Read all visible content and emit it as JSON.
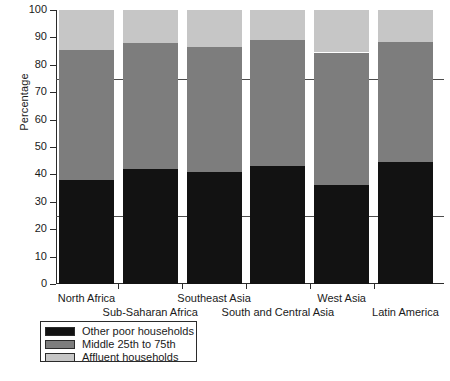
{
  "chart_data": {
    "type": "bar",
    "subtype": "stacked-100-percent",
    "title": "",
    "xlabel": "",
    "ylabel": "Percentage",
    "ylim": [
      0,
      100
    ],
    "yticks": [
      0,
      10,
      20,
      30,
      40,
      50,
      60,
      70,
      80,
      90,
      100
    ],
    "grid": false,
    "reference_lines": [
      25,
      75
    ],
    "legend_position": "below-left",
    "categories": [
      "North Africa",
      "Sub-Saharan Africa",
      "Southeast Asia",
      "South and Central Asia",
      "West Asia",
      "Latin America"
    ],
    "series": [
      {
        "name": "Other poor households",
        "color": "#121212",
        "values": [
          38.0,
          42.0,
          41.0,
          43.0,
          36.0,
          44.5
        ]
      },
      {
        "name": "Middle 25th to 75th",
        "color": "#7d7d7d",
        "values": [
          47.5,
          46.0,
          45.5,
          46.0,
          48.5,
          44.0
        ]
      },
      {
        "name": "Affluent households",
        "color": "#c6c6c6",
        "values": [
          14.5,
          12.0,
          13.5,
          11.0,
          15.5,
          11.5
        ]
      }
    ],
    "cumulative_tops": {
      "poor": [
        38.0,
        42.0,
        41.0,
        43.0,
        36.0,
        44.5
      ],
      "poor_plus_middle": [
        85.5,
        88.0,
        86.5,
        89.0,
        84.5,
        88.5
      ],
      "total": [
        100,
        100,
        100,
        100,
        100,
        100
      ]
    }
  },
  "axis": {
    "y_label": "Percentage",
    "y_tick_labels": [
      "0",
      "10",
      "20",
      "30",
      "40",
      "50",
      "60",
      "70",
      "80",
      "90",
      "100"
    ]
  },
  "x_labels": [
    {
      "text": "North Africa",
      "row": 0
    },
    {
      "text": "Sub-Saharan Africa",
      "row": 1
    },
    {
      "text": "Southeast Asia",
      "row": 0
    },
    {
      "text": "South and Central Asia",
      "row": 1
    },
    {
      "text": "West Asia",
      "row": 0
    },
    {
      "text": "Latin America",
      "row": 1
    }
  ],
  "legend": {
    "items": [
      {
        "label": "Other poor households",
        "swatch": "poor"
      },
      {
        "label": "Middle 25th to 75th",
        "swatch": "middle"
      },
      {
        "label": "Affluent households",
        "swatch": "affluent"
      }
    ]
  }
}
